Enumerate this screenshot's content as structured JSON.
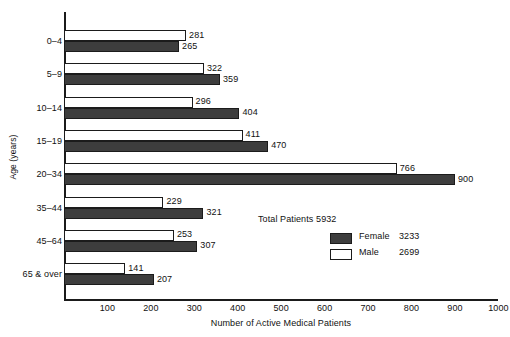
{
  "chart_data": {
    "type": "bar",
    "orientation": "horizontal",
    "title": "",
    "xlabel": "Number of Active Medical Patients",
    "ylabel": "Age (years)",
    "categories": [
      "0–4",
      "5–9",
      "10–14",
      "15–19",
      "20–34",
      "35–44",
      "45–64",
      "65 & over"
    ],
    "series": [
      {
        "name": "Male",
        "values": [
          281,
          322,
          296,
          411,
          766,
          229,
          253,
          141
        ],
        "color": "#ffffff"
      },
      {
        "name": "Female",
        "values": [
          265,
          359,
          404,
          470,
          900,
          321,
          307,
          207
        ],
        "color": "#3d3d3d"
      }
    ],
    "xlim": [
      0,
      1000
    ],
    "xticks": [
      100,
      200,
      300,
      400,
      500,
      600,
      700,
      800,
      900,
      1000
    ],
    "grid": false,
    "legend_position": "inside-right",
    "legend": {
      "total_label": "Total Patients 5932",
      "entries": [
        {
          "name": "Female",
          "value": "3233"
        },
        {
          "name": "Male",
          "value": "2699"
        }
      ]
    }
  },
  "axis": {
    "y_title": "Age (years)",
    "x_title": "Number of Active Medical Patients",
    "x_tick_labels": [
      "100",
      "200",
      "300",
      "400",
      "500",
      "600",
      "700",
      "800",
      "900",
      "1000"
    ]
  },
  "categories": [
    {
      "label": "0–4"
    },
    {
      "label": "5–9"
    },
    {
      "label": "10–14"
    },
    {
      "label": "15–19"
    },
    {
      "label": "20–34"
    },
    {
      "label": "35–44"
    },
    {
      "label": "45–64"
    },
    {
      "label": "65 & over"
    }
  ],
  "values": {
    "male": [
      "281",
      "322",
      "296",
      "411",
      "766",
      "229",
      "253",
      "141"
    ],
    "female": [
      "265",
      "359",
      "404",
      "470",
      "900",
      "321",
      "307",
      "207"
    ]
  },
  "legend": {
    "total": "Total Patients 5932",
    "female_name": "Female",
    "female_value": "3233",
    "male_name": "Male",
    "male_value": "2699"
  },
  "colors": {
    "female_fill": "#3d3d3d",
    "male_fill": "#ffffff",
    "line": "#1b1b1b"
  }
}
